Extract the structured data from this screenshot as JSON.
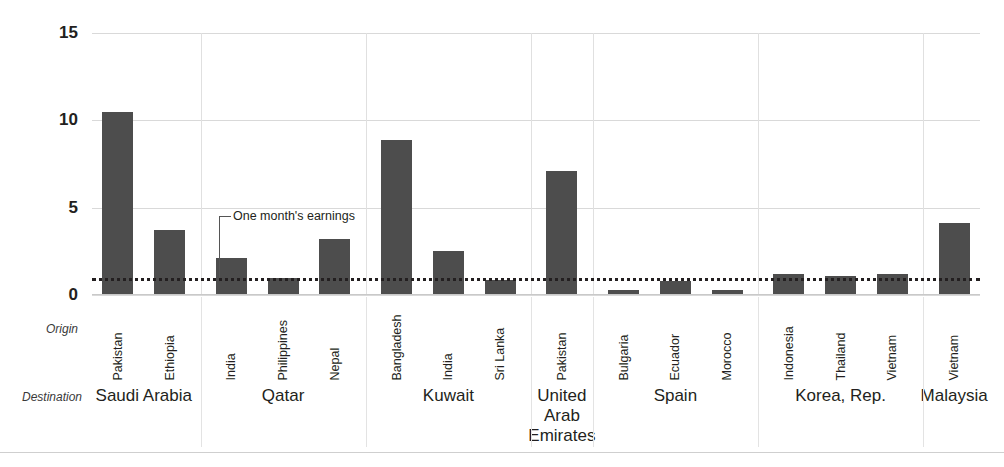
{
  "chart_data": {
    "type": "bar",
    "title": "",
    "xlabel": "",
    "ylabel": "",
    "ylim": [
      0,
      15
    ],
    "yticks": [
      0,
      5,
      10,
      15
    ],
    "grid": true,
    "legend_position": "none",
    "group_axis_label": "Destination",
    "category_axis_label": "Origin",
    "reference_line": {
      "value": 1,
      "label": "One month's earnings",
      "style": "dotted"
    },
    "groups": [
      {
        "destination": "Saudi Arabia",
        "bars": [
          {
            "origin": "Pakistan",
            "value": 10.5
          },
          {
            "origin": "Ethiopia",
            "value": 3.7
          }
        ]
      },
      {
        "destination": "Qatar",
        "bars": [
          {
            "origin": "India",
            "value": 2.1
          },
          {
            "origin": "Philippines",
            "value": 1.0
          },
          {
            "origin": "Nepal",
            "value": 3.2
          }
        ]
      },
      {
        "destination": "Kuwait",
        "bars": [
          {
            "origin": "Bangladesh",
            "value": 8.9
          },
          {
            "origin": "India",
            "value": 2.5
          },
          {
            "origin": "Sri Lanka",
            "value": 0.85
          }
        ]
      },
      {
        "destination": "United Arab Emirates",
        "bars": [
          {
            "origin": "Pakistan",
            "value": 7.1
          }
        ]
      },
      {
        "destination": "Spain",
        "bars": [
          {
            "origin": "Bulgaria",
            "value": 0.3
          },
          {
            "origin": "Ecuador",
            "value": 0.8
          },
          {
            "origin": "Morocco",
            "value": 0.3
          }
        ]
      },
      {
        "destination": "Korea, Rep.",
        "bars": [
          {
            "origin": "Indonesia",
            "value": 1.2
          },
          {
            "origin": "Thailand",
            "value": 1.1
          },
          {
            "origin": "Vietnam",
            "value": 1.2
          }
        ]
      },
      {
        "destination": "Malaysia",
        "bars": [
          {
            "origin": "Vietnam",
            "value": 4.1
          }
        ]
      }
    ]
  },
  "style": {
    "bar_color": "#4d4d4d",
    "grid_color": "#d9d9d9",
    "text_color": "#231f20",
    "reference_line_color": "#231f20"
  }
}
